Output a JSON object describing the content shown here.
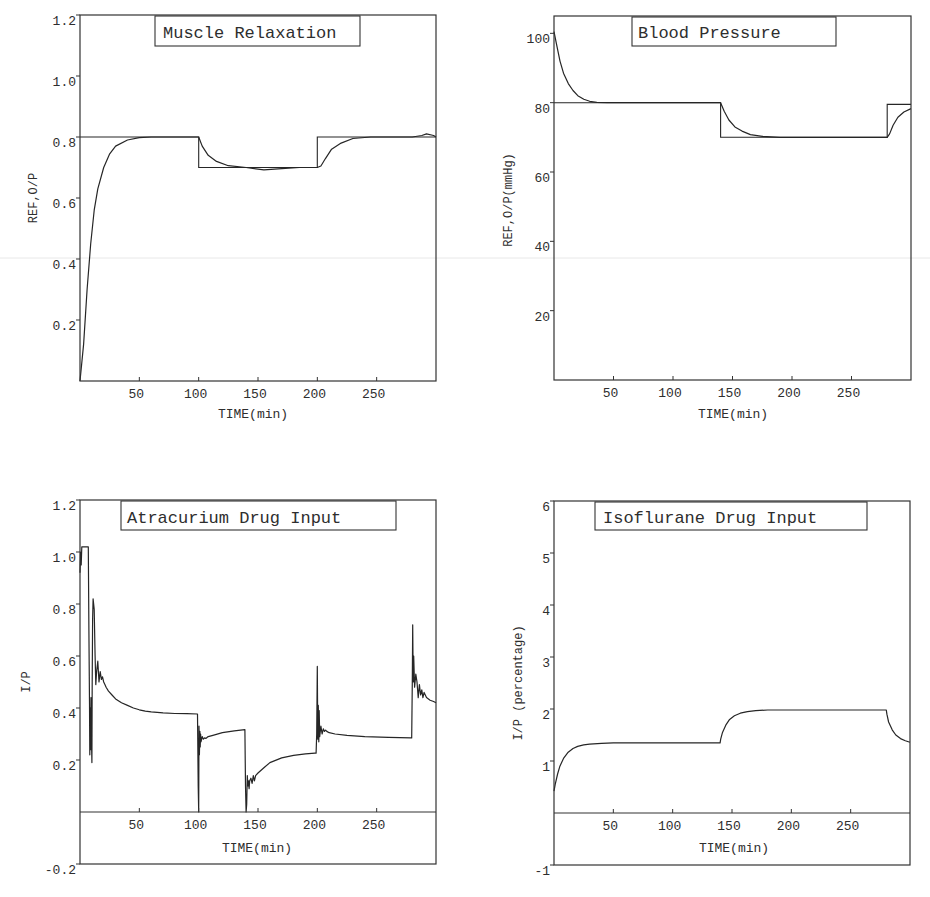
{
  "chart_data": [
    {
      "id": "muscle",
      "type": "line",
      "title": "Muscle Relaxation",
      "xlabel": "TIME(min)",
      "ylabel": "REF,O/P",
      "xlim": [
        0,
        300
      ],
      "ylim": [
        0,
        1.2
      ],
      "xticks": [
        50,
        100,
        150,
        200,
        250
      ],
      "xtick_labels": [
        "50",
        "100",
        "150",
        "200",
        "250"
      ],
      "yticks": [
        0.2,
        0.4,
        0.6,
        0.8,
        1.0,
        1.2
      ],
      "ytick_labels": [
        "0.2",
        "0.4",
        "0.6",
        "0.8",
        "1.0",
        "1.2"
      ],
      "grid": false,
      "legend": "none",
      "series": [
        {
          "name": "REF",
          "style": "step",
          "x": [
            0,
            100,
            100,
            200,
            200,
            300
          ],
          "y": [
            0.8,
            0.8,
            0.7,
            0.7,
            0.8,
            0.8
          ]
        },
        {
          "name": "O/P",
          "x": [
            0,
            3,
            6,
            9,
            12,
            15,
            20,
            25,
            30,
            40,
            50,
            60,
            100,
            103,
            108,
            115,
            125,
            140,
            155,
            170,
            185,
            200,
            203,
            207,
            212,
            220,
            230,
            245,
            280,
            288,
            292,
            298,
            300
          ],
          "y": [
            0,
            0.12,
            0.3,
            0.45,
            0.56,
            0.63,
            0.7,
            0.745,
            0.77,
            0.79,
            0.798,
            0.8,
            0.8,
            0.77,
            0.74,
            0.72,
            0.706,
            0.7,
            0.692,
            0.696,
            0.7,
            0.7,
            0.705,
            0.73,
            0.76,
            0.78,
            0.795,
            0.8,
            0.8,
            0.805,
            0.81,
            0.805,
            0.8
          ]
        }
      ]
    },
    {
      "id": "bp",
      "type": "line",
      "title": "Blood Pressure",
      "xlabel": "TIME(min)",
      "ylabel": "REF,O/P(mmHg)",
      "xlim": [
        0,
        300
      ],
      "ylim": [
        0,
        105
      ],
      "xticks": [
        50,
        100,
        150,
        200,
        250
      ],
      "xtick_labels": [
        "50",
        "100",
        "150",
        "200",
        "250"
      ],
      "yticks": [
        20,
        40,
        60,
        80,
        100
      ],
      "ytick_labels": [
        "20",
        "40",
        "60",
        "80",
        "100"
      ],
      "grid": false,
      "legend": "none",
      "series": [
        {
          "name": "REF",
          "style": "step",
          "x": [
            0,
            140,
            140,
            280,
            280,
            300
          ],
          "y": [
            80,
            80,
            70,
            70,
            79.5,
            79.5
          ]
        },
        {
          "name": "O/P",
          "x": [
            0,
            2,
            5,
            8,
            12,
            16,
            20,
            25,
            30,
            36,
            45,
            140,
            143,
            147,
            152,
            158,
            165,
            175,
            190,
            280,
            282,
            285,
            289,
            294,
            300
          ],
          "y": [
            100.5,
            97,
            92,
            88.5,
            85.5,
            83.5,
            82,
            81,
            80.4,
            80.1,
            80,
            80,
            77.5,
            75,
            73,
            71.8,
            70.8,
            70.3,
            70,
            70,
            71,
            73.5,
            75.8,
            77.3,
            78.3
          ]
        }
      ]
    },
    {
      "id": "atracurium",
      "type": "line",
      "title": "Atracurium Drug Input",
      "xlabel": "TIME(min)",
      "ylabel": "I/P",
      "xlim": [
        0,
        300
      ],
      "ylim": [
        -0.2,
        1.2
      ],
      "xticks": [
        50,
        100,
        150,
        200,
        250
      ],
      "xtick_labels": [
        "50",
        "100",
        "150",
        "200",
        "250"
      ],
      "yticks": [
        -0.2,
        0.2,
        0.4,
        0.6,
        0.8,
        1.0,
        1.2
      ],
      "ytick_labels": [
        "-0.2",
        "0.2",
        "0.4",
        "0.6",
        "0.8",
        "1.0",
        "1.2"
      ],
      "grid": false,
      "legend": "none",
      "series": [
        {
          "name": "I/P",
          "x": [
            0,
            0.5,
            1,
            1.5,
            2,
            3,
            5,
            6,
            7,
            7.5,
            8,
            8.3,
            8.6,
            9,
            9.3,
            9.6,
            10,
            10.3,
            10.6,
            11,
            12,
            12.7,
            13.3,
            14,
            15,
            16,
            17,
            18,
            19,
            20,
            21,
            22,
            24,
            27,
            30,
            35,
            40,
            45,
            50,
            55,
            60,
            70,
            80,
            90,
            99,
            99.6,
            100,
            100.3,
            100.6,
            101,
            101.3,
            101.6,
            102,
            103,
            104,
            105,
            106,
            108,
            112,
            120,
            130,
            139,
            139.5,
            140,
            140.5,
            141,
            141.5,
            142,
            142.5,
            143,
            144,
            145,
            146,
            147,
            148,
            150,
            155,
            160,
            170,
            180,
            190,
            198,
            199,
            199.5,
            200,
            200.4,
            200.8,
            201.2,
            201.6,
            202,
            203,
            204,
            205,
            206,
            207,
            208,
            210,
            215,
            225,
            240,
            260,
            279,
            279.5,
            280,
            280.4,
            280.8,
            281.2,
            282,
            283,
            284,
            285,
            286,
            287,
            288,
            289,
            290,
            292,
            295,
            298,
            300
          ],
          "y": [
            0.92,
            1.0,
            0.95,
            1.02,
            1.02,
            1.02,
            1.02,
            1.02,
            1.02,
            0.7,
            0.42,
            0.22,
            0.4,
            0.24,
            0.44,
            0.3,
            0.19,
            0.5,
            0.74,
            0.82,
            0.78,
            0.6,
            0.49,
            0.54,
            0.58,
            0.5,
            0.54,
            0.51,
            0.52,
            0.5,
            0.49,
            0.48,
            0.465,
            0.45,
            0.435,
            0.42,
            0.41,
            0.4,
            0.393,
            0.388,
            0.385,
            0.381,
            0.379,
            0.378,
            0.377,
            0.1,
            0.0,
            0.33,
            0.22,
            0.31,
            0.25,
            0.3,
            0.27,
            0.29,
            0.28,
            0.285,
            0.283,
            0.29,
            0.295,
            0.305,
            0.312,
            0.317,
            0.1,
            0.0,
            0.03,
            0.14,
            0.1,
            0.12,
            0.09,
            0.12,
            0.13,
            0.11,
            0.14,
            0.12,
            0.14,
            0.15,
            0.17,
            0.19,
            0.208,
            0.218,
            0.224,
            0.226,
            0.226,
            0.3,
            0.56,
            0.28,
            0.41,
            0.27,
            0.39,
            0.29,
            0.33,
            0.3,
            0.32,
            0.31,
            0.315,
            0.31,
            0.305,
            0.3,
            0.295,
            0.29,
            0.287,
            0.285,
            0.285,
            0.5,
            0.72,
            0.5,
            0.6,
            0.48,
            0.53,
            0.5,
            0.44,
            0.49,
            0.45,
            0.47,
            0.44,
            0.46,
            0.44,
            0.43,
            0.425,
            0.42,
            0.415,
            0.41
          ]
        }
      ]
    },
    {
      "id": "isoflurane",
      "type": "line",
      "title": "Isoflurane Drug Input",
      "xlabel": "TIME(min)",
      "ylabel": "I/P (percentage)",
      "xlim": [
        0,
        300
      ],
      "ylim": [
        -1,
        6
      ],
      "xticks": [
        50,
        100,
        150,
        200,
        250
      ],
      "xtick_labels": [
        "50",
        "100",
        "150",
        "200",
        "250"
      ],
      "yticks": [
        -1,
        1,
        2,
        3,
        4,
        5,
        6
      ],
      "ytick_labels": [
        "-1",
        "1",
        "2",
        "3",
        "4",
        "5",
        "6"
      ],
      "grid": false,
      "legend": "none",
      "series": [
        {
          "name": "I/P",
          "x": [
            0,
            1,
            3,
            5,
            8,
            12,
            16,
            20,
            25,
            30,
            40,
            50,
            140,
            140.5,
            142,
            145,
            148,
            152,
            157,
            163,
            170,
            180,
            280,
            280.5,
            282,
            285,
            288,
            292,
            296,
            300
          ],
          "y": [
            0.42,
            0.55,
            0.75,
            0.9,
            1.05,
            1.17,
            1.24,
            1.28,
            1.31,
            1.325,
            1.34,
            1.35,
            1.35,
            1.42,
            1.55,
            1.7,
            1.8,
            1.87,
            1.92,
            1.95,
            1.97,
            1.98,
            1.98,
            1.9,
            1.75,
            1.6,
            1.5,
            1.43,
            1.39,
            1.36
          ]
        }
      ]
    }
  ]
}
